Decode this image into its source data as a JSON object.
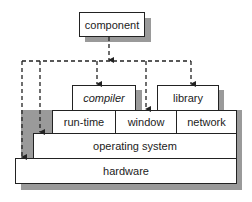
{
  "diagram": {
    "top": {
      "label": "component"
    },
    "apps": [
      {
        "label": "compiler",
        "italic": true
      },
      {
        "label": "library",
        "italic": false
      }
    ],
    "middleware": [
      {
        "label": "run-time"
      },
      {
        "label": "window"
      },
      {
        "label": "network"
      }
    ],
    "os": {
      "label": "operating system"
    },
    "hardware": {
      "label": "hardware"
    },
    "connections": {
      "style": "dashed-arrow",
      "from": "component",
      "to": [
        "hardware",
        "operating system",
        "compiler",
        "window",
        "library"
      ]
    }
  }
}
